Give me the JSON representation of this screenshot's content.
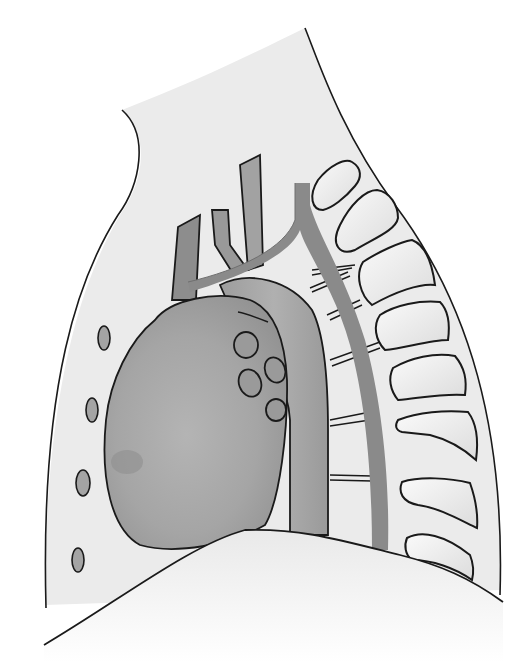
{
  "figure": {
    "type": "anatomical-illustration",
    "view": "lateral chest",
    "structures": [
      "chest-wall-outline",
      "heart",
      "ascending-aorta",
      "aortic-arch",
      "descending-aorta",
      "great-vessels",
      "pulmonary-hilar-nodes",
      "anterior-chest-nodules",
      "intercostal-vessels",
      "thoracic-vertebrae",
      "diaphragm"
    ],
    "colors": {
      "background": "#ffffff",
      "chest_fill": "#ebebeb",
      "outline": "#1a1a1a",
      "heart_fill": "#a8a8a8",
      "vessel_fill": "#8c8c8c",
      "vertebra_fill": "#f4f4f4",
      "node_fill": "#9a9a9a",
      "diaphragm_fill": "#f6f6f6"
    },
    "vertebra_count": 8,
    "hilar_node_count": 5,
    "anterior_nodule_count": 4
  }
}
